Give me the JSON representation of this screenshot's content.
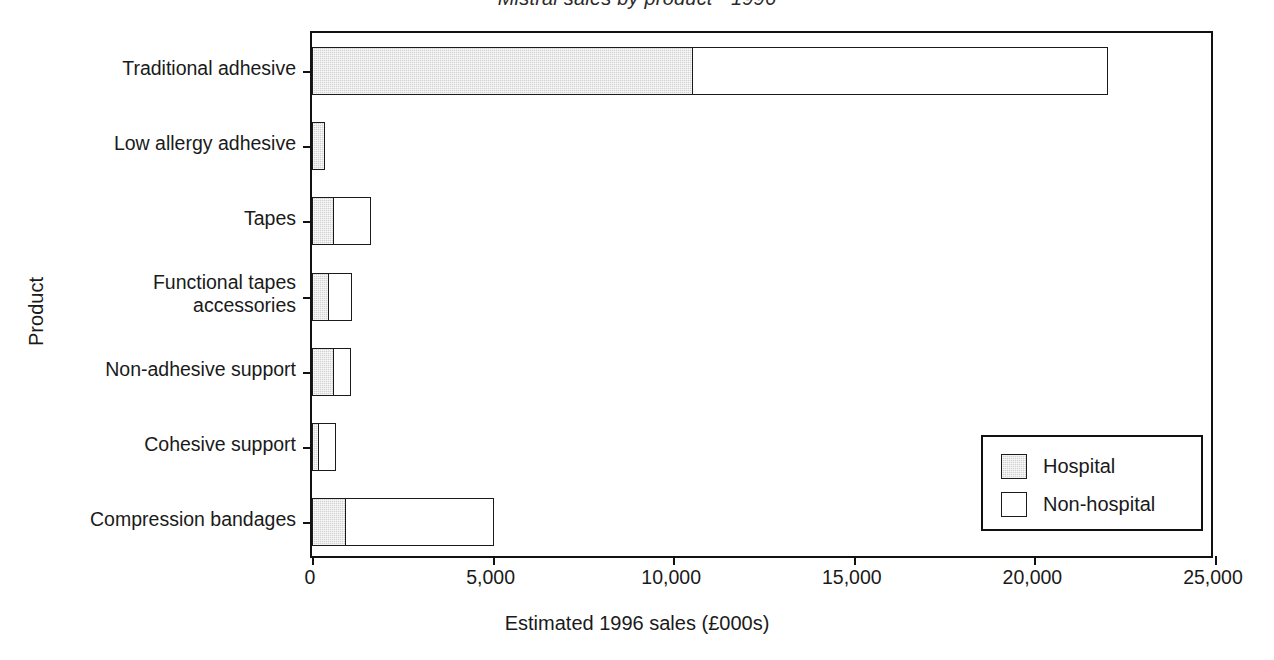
{
  "chart_data": {
    "type": "bar",
    "orientation": "horizontal",
    "stacked": true,
    "title": "Mistral sales by product - 1996",
    "xlabel": "Estimated 1996 sales (£000s)",
    "ylabel": "Product",
    "xlim": [
      0,
      25000
    ],
    "xticks": [
      0,
      5000,
      10000,
      15000,
      20000,
      25000
    ],
    "xticklabels": [
      "0",
      "5,000",
      "10,000",
      "15,000",
      "20,000",
      "25,000"
    ],
    "grid": false,
    "legend_position": "lower right",
    "categories": [
      "Traditional adhesive",
      "Low allergy adhesive",
      "Tapes",
      "Functional tapes\naccessories",
      "Non-adhesive support",
      "Cohesive support",
      "Compression bandages"
    ],
    "series": [
      {
        "name": "Hospital",
        "color": "#d2d2d2",
        "values": [
          10500,
          330,
          560,
          440,
          560,
          150,
          900
        ]
      },
      {
        "name": "Non-hospital",
        "color": "#ffffff",
        "values": [
          11500,
          0,
          1040,
          620,
          490,
          460,
          4100
        ]
      }
    ],
    "totals": [
      22000,
      330,
      1600,
      1060,
      1050,
      610,
      5000
    ]
  },
  "legend": {
    "entries": [
      {
        "label": "Hospital",
        "swatch": "hatched-gray"
      },
      {
        "label": "Non-hospital",
        "swatch": "white"
      }
    ]
  }
}
